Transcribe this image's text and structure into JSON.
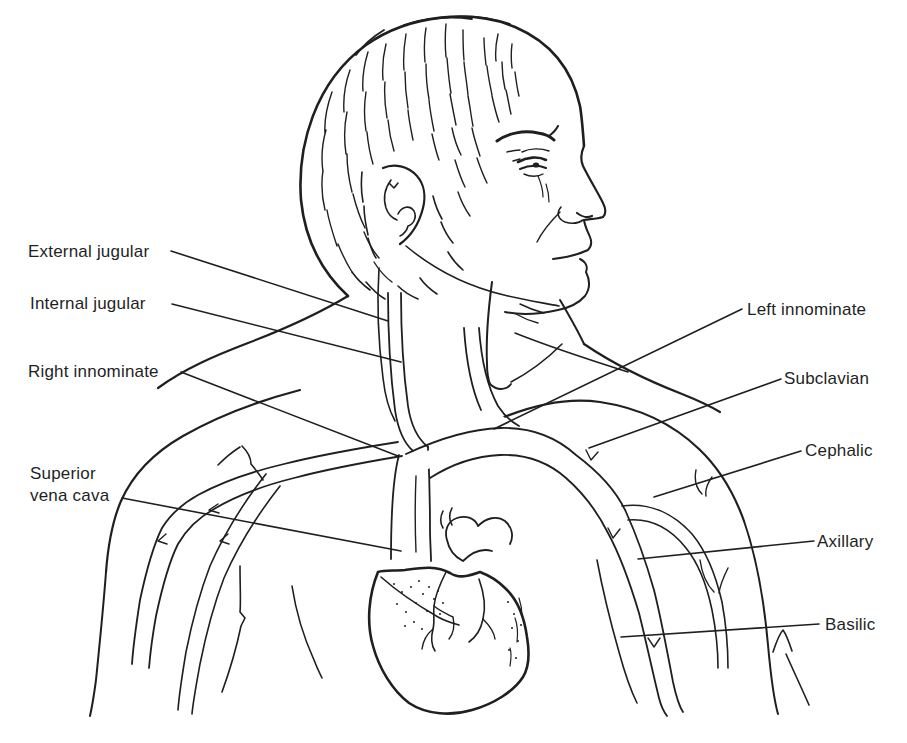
{
  "figure": {
    "colors": {
      "ink": "#1f1f1f",
      "bg": "#ffffff"
    },
    "labels": {
      "external_jugular": "External jugular",
      "internal_jugular": "Internal jugular",
      "right_innominate": "Right innominate",
      "superior_vena_cava_line1": "Superior",
      "superior_vena_cava_line2": "vena cava",
      "left_innominate": "Left innominate",
      "subclavian": "Subclavian",
      "cephalic": "Cephalic",
      "axillary": "Axillary",
      "basilic": "Basilic"
    }
  }
}
